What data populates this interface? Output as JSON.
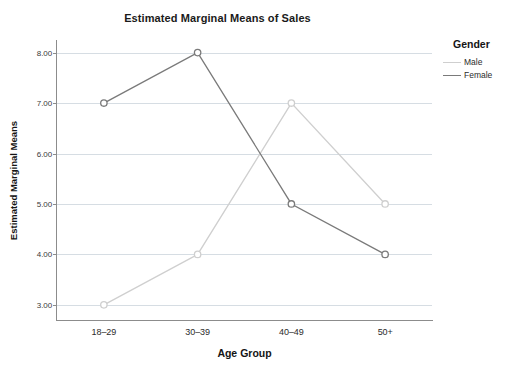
{
  "chart_data": {
    "type": "line",
    "title": "Estimated Marginal Means of Sales",
    "xlabel": "Age Group",
    "ylabel": "Estimated Marginal Means",
    "categories": [
      "18–29",
      "30–39",
      "40–49",
      "50+"
    ],
    "ytick_labels": [
      "3.00",
      "4.00",
      "5.00",
      "6.00",
      "7.00",
      "8.00"
    ],
    "yticks": [
      3,
      4,
      5,
      6,
      7,
      8
    ],
    "ylim": [
      2.7,
      8.25
    ],
    "grid": true,
    "legend_position": "right",
    "legend_title": "Gender",
    "marker": "open-circle",
    "series": [
      {
        "name": "Male",
        "color": "#cfcfcf",
        "values": [
          3,
          4,
          7,
          5
        ]
      },
      {
        "name": "Female",
        "color": "#7a7a7a",
        "values": [
          7,
          8,
          5,
          4
        ]
      }
    ]
  },
  "axis": {
    "line_color": "#8c8c8c",
    "grid_color": "#d6dde3"
  }
}
